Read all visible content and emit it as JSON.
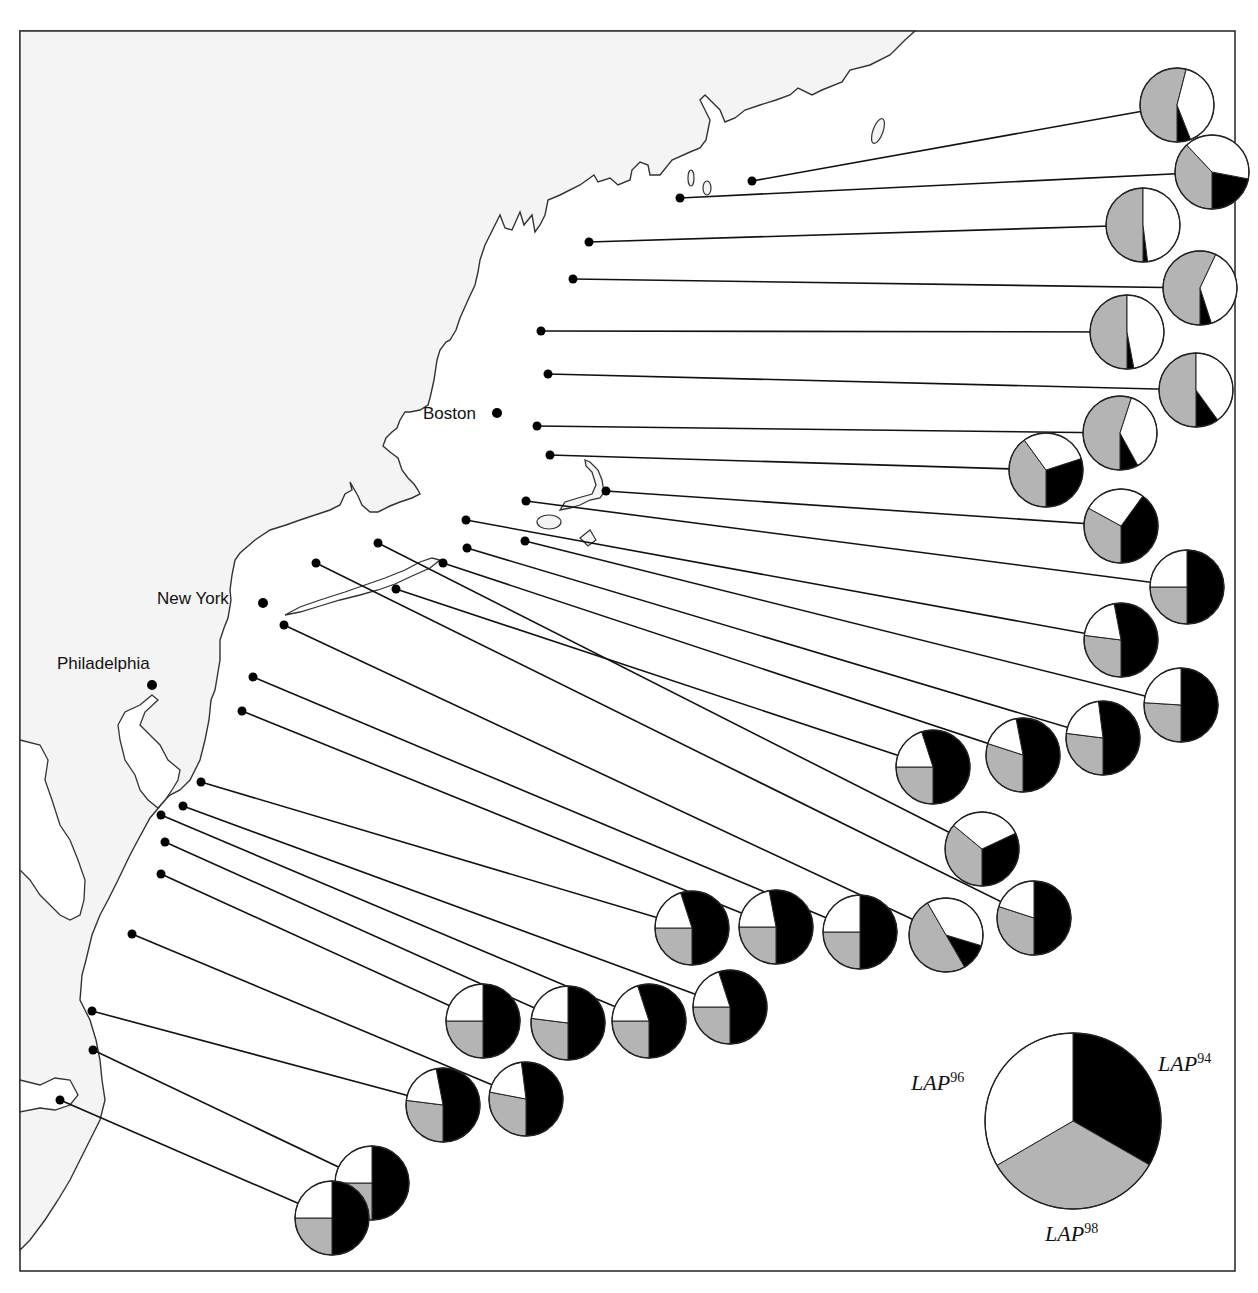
{
  "chart_data": {
    "type": "pie",
    "title": "",
    "colors": {
      "LAP94": "#000000",
      "LAP98": "#b4b4b4",
      "LAP96": "#ffffff",
      "land": "#f4f4f4",
      "line": "#111111"
    },
    "legend": {
      "entries": [
        {
          "allele": "LAP",
          "sup": "94",
          "color": "#000000"
        },
        {
          "allele": "LAP",
          "sup": "96",
          "color": "#ffffff"
        },
        {
          "allele": "LAP",
          "sup": "98",
          "color": "#b4b4b4"
        }
      ],
      "example_fractions": {
        "LAP94": 0.333,
        "LAP98": 0.333,
        "LAP96": 0.334
      }
    },
    "cities": [
      {
        "name": "Boston",
        "x": 497,
        "y": 413
      },
      {
        "name": "New York",
        "x": 263,
        "y": 603
      },
      {
        "name": "Philadelphia",
        "x": 152,
        "y": 685
      }
    ],
    "sites": [
      {
        "dot": [
          752,
          181
        ],
        "pie": [
          1177,
          105
        ],
        "LAP94": 0.06,
        "LAP98": 0.54,
        "LAP96": 0.4
      },
      {
        "dot": [
          680,
          198
        ],
        "pie": [
          1212,
          172
        ],
        "LAP94": 0.22,
        "LAP98": 0.38,
        "LAP96": 0.4
      },
      {
        "dot": [
          589,
          242
        ],
        "pie": [
          1143,
          225
        ],
        "LAP94": 0.02,
        "LAP98": 0.5,
        "LAP96": 0.48
      },
      {
        "dot": [
          573,
          279
        ],
        "pie": [
          1200,
          288
        ],
        "LAP94": 0.05,
        "LAP98": 0.57,
        "LAP96": 0.38
      },
      {
        "dot": [
          541,
          331
        ],
        "pie": [
          1127,
          332
        ],
        "LAP94": 0.03,
        "LAP98": 0.5,
        "LAP96": 0.47
      },
      {
        "dot": [
          548,
          374
        ],
        "pie": [
          1196,
          390
        ],
        "LAP94": 0.1,
        "LAP98": 0.5,
        "LAP96": 0.4
      },
      {
        "dot": [
          537,
          426
        ],
        "pie": [
          1120,
          433
        ],
        "LAP94": 0.08,
        "LAP98": 0.55,
        "LAP96": 0.37
      },
      {
        "dot": [
          550,
          455
        ],
        "pie": [
          1046,
          470
        ],
        "LAP94": 0.3,
        "LAP98": 0.4,
        "LAP96": 0.3
      },
      {
        "dot": [
          606,
          491
        ],
        "pie": [
          1121,
          526
        ],
        "LAP94": 0.4,
        "LAP98": 0.33,
        "LAP96": 0.27
      },
      {
        "dot": [
          526,
          501
        ],
        "pie": [
          1187,
          587
        ],
        "LAP94": 0.5,
        "LAP98": 0.25,
        "LAP96": 0.25
      },
      {
        "dot": [
          466,
          520
        ],
        "pie": [
          1121,
          640
        ],
        "LAP94": 0.53,
        "LAP98": 0.27,
        "LAP96": 0.2
      },
      {
        "dot": [
          525,
          541
        ],
        "pie": [
          1181,
          705
        ],
        "LAP94": 0.5,
        "LAP98": 0.26,
        "LAP96": 0.24
      },
      {
        "dot": [
          467,
          548
        ],
        "pie": [
          1103,
          738
        ],
        "LAP94": 0.52,
        "LAP98": 0.27,
        "LAP96": 0.21
      },
      {
        "dot": [
          443,
          563
        ],
        "pie": [
          1023,
          755
        ],
        "LAP94": 0.53,
        "LAP98": 0.3,
        "LAP96": 0.17
      },
      {
        "dot": [
          396,
          589
        ],
        "pie": [
          933,
          767
        ],
        "LAP94": 0.55,
        "LAP98": 0.25,
        "LAP96": 0.2
      },
      {
        "dot": [
          378,
          543
        ],
        "pie": [
          982,
          849
        ],
        "LAP94": 0.32,
        "LAP98": 0.36,
        "LAP96": 0.32
      },
      {
        "dot": [
          316,
          563
        ],
        "pie": [
          1034,
          918
        ],
        "LAP94": 0.5,
        "LAP98": 0.3,
        "LAP96": 0.2
      },
      {
        "dot": [
          284,
          625
        ],
        "pie": [
          946,
          935
        ],
        "LAP94": 0.12,
        "LAP98": 0.5,
        "LAP96": 0.38,
        "black_end": 150
      },
      {
        "dot": [
          253,
          677
        ],
        "pie": [
          860,
          932
        ],
        "LAP94": 0.5,
        "LAP98": 0.25,
        "LAP96": 0.25
      },
      {
        "dot": [
          242,
          711
        ],
        "pie": [
          776,
          927
        ],
        "LAP94": 0.53,
        "LAP98": 0.25,
        "LAP96": 0.22
      },
      {
        "dot": [
          201,
          782
        ],
        "pie": [
          692,
          928
        ],
        "LAP94": 0.55,
        "LAP98": 0.25,
        "LAP96": 0.2
      },
      {
        "dot": [
          183,
          806
        ],
        "pie": [
          730,
          1007
        ],
        "LAP94": 0.55,
        "LAP98": 0.25,
        "LAP96": 0.2
      },
      {
        "dot": [
          161,
          815
        ],
        "pie": [
          649,
          1021
        ],
        "LAP94": 0.55,
        "LAP98": 0.25,
        "LAP96": 0.2
      },
      {
        "dot": [
          165,
          842
        ],
        "pie": [
          568,
          1023
        ],
        "LAP94": 0.5,
        "LAP98": 0.27,
        "LAP96": 0.23
      },
      {
        "dot": [
          161,
          874
        ],
        "pie": [
          483,
          1021
        ],
        "LAP94": 0.5,
        "LAP98": 0.25,
        "LAP96": 0.25
      },
      {
        "dot": [
          132,
          934
        ],
        "pie": [
          526,
          1099
        ],
        "LAP94": 0.52,
        "LAP98": 0.28,
        "LAP96": 0.2
      },
      {
        "dot": [
          92,
          1011
        ],
        "pie": [
          443,
          1105
        ],
        "LAP94": 0.53,
        "LAP98": 0.27,
        "LAP96": 0.2
      },
      {
        "dot": [
          93,
          1050
        ],
        "pie": [
          372,
          1183
        ],
        "LAP94": 0.5,
        "LAP98": 0.25,
        "LAP96": 0.25
      },
      {
        "dot": [
          60,
          1100
        ],
        "pie": [
          332,
          1218
        ],
        "LAP94": 0.5,
        "LAP98": 0.25,
        "LAP96": 0.25
      }
    ],
    "pie_radius": 37,
    "legend_pie": {
      "cx": 1073,
      "cy": 1121,
      "r": 88
    }
  },
  "labels": {
    "boston": "Boston",
    "new_york": "New York",
    "philadelphia": "Philadelphia",
    "legend_94": "LAP",
    "legend_94_sup": "94",
    "legend_96": "LAP",
    "legend_96_sup": "96",
    "legend_98": "LAP",
    "legend_98_sup": "98"
  }
}
